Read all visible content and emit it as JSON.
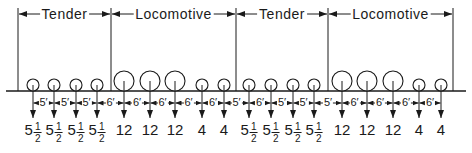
{
  "diagram": {
    "colors": {
      "line": "#1a1a1a",
      "background": "#ffffff"
    },
    "boundaries_x": [
      18,
      111,
      236,
      328,
      453
    ],
    "ground_y": 91,
    "sections": [
      {
        "label": "Tender",
        "x_start": 18,
        "x_end": 111
      },
      {
        "label": "Locomotive",
        "x_start": 111,
        "x_end": 236
      },
      {
        "label": "Tender",
        "x_start": 236,
        "x_end": 328
      },
      {
        "label": "Locomotive",
        "x_start": 328,
        "x_end": 453
      }
    ],
    "wheels": [
      {
        "x": 33,
        "r": 6,
        "load_whole": "5",
        "load_frac_num": "1",
        "load_frac_den": "2"
      },
      {
        "x": 54,
        "r": 6,
        "load_whole": "5",
        "load_frac_num": "1",
        "load_frac_den": "2"
      },
      {
        "x": 76,
        "r": 6,
        "load_whole": "5",
        "load_frac_num": "1",
        "load_frac_den": "2"
      },
      {
        "x": 97,
        "r": 6,
        "load_whole": "5",
        "load_frac_num": "1",
        "load_frac_den": "2"
      },
      {
        "x": 124,
        "r": 10,
        "load_whole": "12",
        "load_frac_num": "",
        "load_frac_den": ""
      },
      {
        "x": 150,
        "r": 10,
        "load_whole": "12",
        "load_frac_num": "",
        "load_frac_den": ""
      },
      {
        "x": 175,
        "r": 10,
        "load_whole": "12",
        "load_frac_num": "",
        "load_frac_den": ""
      },
      {
        "x": 202,
        "r": 6,
        "load_whole": "4",
        "load_frac_num": "",
        "load_frac_den": ""
      },
      {
        "x": 224,
        "r": 6,
        "load_whole": "4",
        "load_frac_num": "",
        "load_frac_den": ""
      },
      {
        "x": 249,
        "r": 6,
        "load_whole": "5",
        "load_frac_num": "1",
        "load_frac_den": "2"
      },
      {
        "x": 271,
        "r": 6,
        "load_whole": "5",
        "load_frac_num": "1",
        "load_frac_den": "2"
      },
      {
        "x": 293,
        "r": 6,
        "load_whole": "5",
        "load_frac_num": "1",
        "load_frac_den": "2"
      },
      {
        "x": 314,
        "r": 6,
        "load_whole": "5",
        "load_frac_num": "1",
        "load_frac_den": "2"
      },
      {
        "x": 342,
        "r": 10,
        "load_whole": "12",
        "load_frac_num": "",
        "load_frac_den": ""
      },
      {
        "x": 367,
        "r": 10,
        "load_whole": "12",
        "load_frac_num": "",
        "load_frac_den": ""
      },
      {
        "x": 393,
        "r": 10,
        "load_whole": "12",
        "load_frac_num": "",
        "load_frac_den": ""
      },
      {
        "x": 419,
        "r": 6,
        "load_whole": "4",
        "load_frac_num": "",
        "load_frac_den": ""
      },
      {
        "x": 441,
        "r": 6,
        "load_whole": "4",
        "load_frac_num": "",
        "load_frac_den": ""
      }
    ],
    "spacings": [
      "5′",
      "5′",
      "5′",
      "6′",
      "6′",
      "6′",
      "6′",
      "6′",
      "5′",
      "6′",
      "5′",
      "5′",
      "5′",
      "6′",
      "6′",
      "6′",
      "6′",
      "5′"
    ]
  }
}
